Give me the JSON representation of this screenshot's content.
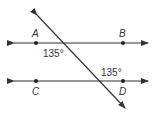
{
  "diagram": {
    "type": "parallel-lines-transversal",
    "points": [
      {
        "label": "A",
        "x": 36,
        "y": 43
      },
      {
        "label": "B",
        "x": 123,
        "y": 43
      },
      {
        "label": "C",
        "x": 36,
        "y": 81
      },
      {
        "label": "D",
        "x": 123,
        "y": 81
      }
    ],
    "angles": [
      {
        "label": "135°",
        "at": "intersection with line AB, below-left"
      },
      {
        "label": "135°",
        "at": "intersection with line CD, above-right"
      }
    ],
    "lines": [
      "AB",
      "CD",
      "transversal"
    ],
    "colors": {
      "stroke": "#333333",
      "background": "#ffffff"
    }
  }
}
